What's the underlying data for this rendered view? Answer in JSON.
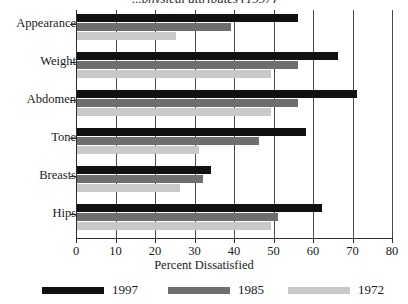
{
  "chart_data": {
    "type": "bar",
    "orientation": "horizontal",
    "title": "...physical attributes (1997)",
    "xlabel": "Percent Dissatisfied",
    "ylabel": "",
    "xlim": [
      0,
      80
    ],
    "xticks": [
      0,
      10,
      20,
      30,
      40,
      50,
      60,
      70,
      80
    ],
    "grid": true,
    "grid_axis": "x",
    "legend_position": "bottom",
    "categories": [
      "Appearance",
      "Weight",
      "Abdomen",
      "Tone",
      "Breasts",
      "Hips"
    ],
    "series": [
      {
        "name": "1997",
        "color": "#111111",
        "values": [
          56,
          66,
          71,
          58,
          34,
          62
        ]
      },
      {
        "name": "1985",
        "color": "#6e6e6e",
        "values": [
          39,
          56,
          56,
          46,
          32,
          51
        ]
      },
      {
        "name": "1972",
        "color": "#c9c9c9",
        "values": [
          25,
          49,
          49,
          31,
          26,
          49
        ]
      }
    ]
  },
  "colors": {
    "axis": "#2b2b2b",
    "grid": "#4a4a4a",
    "background": "#ffffff",
    "text": "#1a1a1a"
  }
}
